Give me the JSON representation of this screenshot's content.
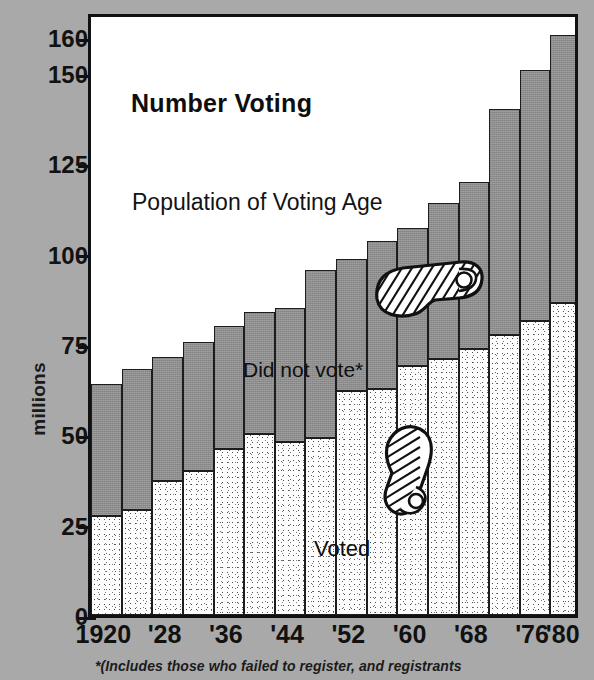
{
  "figure": {
    "title": "Number Voting",
    "y_axis_title": "millions",
    "footnote": "*(Includes those who failed to register, and registrants",
    "series_label_top": "Population of Voting Age",
    "series_label_upper": "Did not vote*",
    "series_label_lower": "Voted",
    "background_color": "#a9a9a9",
    "plot_background_color": "#ffffff",
    "did_not_vote_color": "#8d8d8d",
    "voted_color": "#fdfdfd",
    "ink_color": "#111111"
  },
  "icons": {
    "shoe_upper": "shoe-icon",
    "shoe_lower": "shoe-icon"
  },
  "axes": {
    "y_ticks": [
      0,
      25,
      50,
      75,
      100,
      125,
      150,
      160
    ],
    "y_tick_labels": [
      "0",
      "25",
      "50",
      "75",
      "100",
      "125",
      "150",
      "160"
    ],
    "y_min": 0,
    "y_max": 160,
    "x_tick_labels": [
      "1920",
      "'28",
      "'36",
      "'44",
      "'52",
      "'60",
      "'68",
      "'76",
      "'80"
    ],
    "x_tick_years": [
      1920,
      1928,
      1936,
      1944,
      1952,
      1960,
      1968,
      1976,
      1980
    ]
  },
  "chart_data": {
    "type": "bar",
    "title": "Number Voting",
    "subtitle": "Population of Voting Age",
    "xlabel": "",
    "ylabel": "millions",
    "ylim": [
      0,
      160
    ],
    "grid": false,
    "stacked": true,
    "legend": "in-plot labels",
    "annotations": [
      "Number Voting",
      "Population of Voting Age",
      "Did not vote*",
      "Voted"
    ],
    "footnote": "*(Includes those who failed to register, and registrants",
    "categories": [
      "1920",
      "1924",
      "1928",
      "1932",
      "1936",
      "1940",
      "1944",
      "1948",
      "1952",
      "1956",
      "1960",
      "1964",
      "1968",
      "1972",
      "1976",
      "1980"
    ],
    "tick_categories": [
      "1920",
      "'28",
      "'36",
      "'44",
      "'52",
      "'60",
      "'68",
      "'76",
      "'80"
    ],
    "series": [
      {
        "name": "Voted",
        "color": "#fdfdfd",
        "values": [
          27.5,
          29,
          37,
          40,
          46,
          50,
          48,
          49,
          62,
          62.5,
          69,
          71,
          73.5,
          77.5,
          81.5,
          86.5
        ]
      },
      {
        "name": "Did not vote*",
        "color": "#8d8d8d",
        "values": [
          36.5,
          39,
          34.5,
          35.5,
          34,
          34,
          37,
          46.5,
          36.5,
          41,
          38,
          43,
          46.5,
          62.5,
          69.5,
          74
        ]
      }
    ],
    "totals": {
      "name": "Population of Voting Age",
      "values": [
        64,
        68,
        71.5,
        75.5,
        80,
        84,
        85,
        95.5,
        98.5,
        103.5,
        107,
        114,
        120,
        140,
        151,
        160.5
      ]
    }
  }
}
